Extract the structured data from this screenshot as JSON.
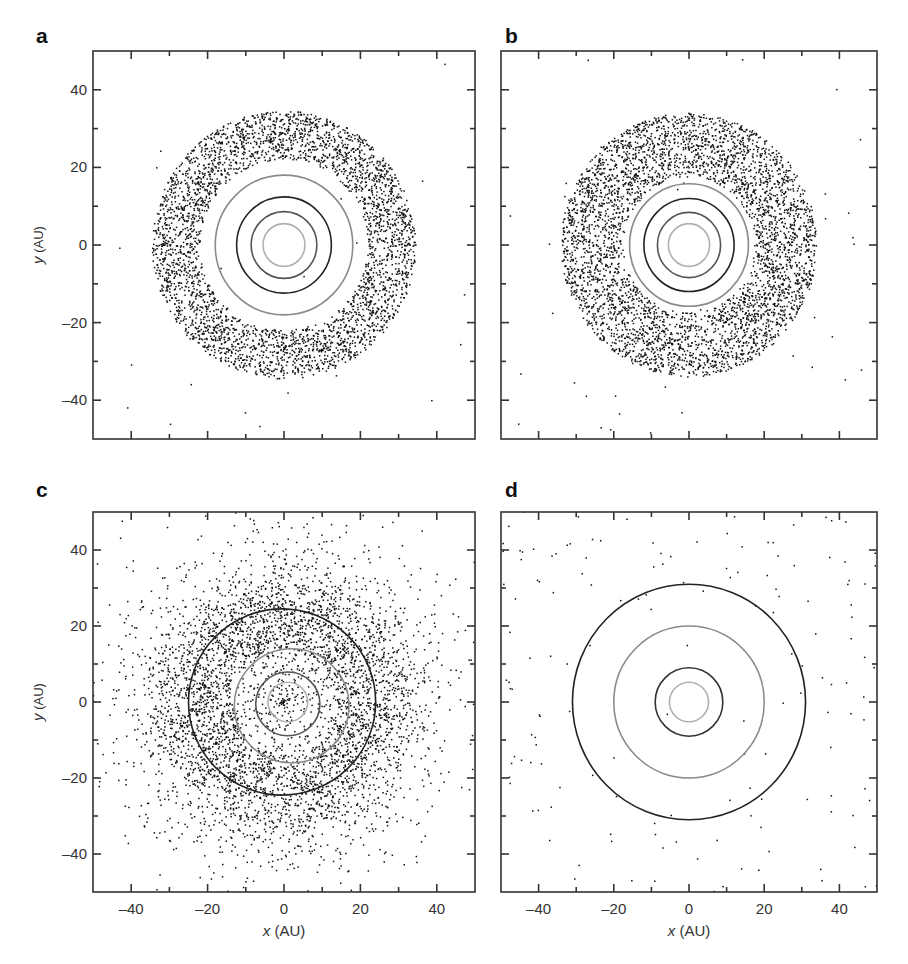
{
  "figure": {
    "panels": [
      {
        "id": "a",
        "letter": "a",
        "show_ylabel": true,
        "show_xlabel": false,
        "show_yticklabels": true,
        "show_xticklabels": false
      },
      {
        "id": "b",
        "letter": "b",
        "show_ylabel": false,
        "show_xlabel": false,
        "show_yticklabels": false,
        "show_xticklabels": false
      },
      {
        "id": "c",
        "letter": "c",
        "show_ylabel": true,
        "show_xlabel": true,
        "show_yticklabels": true,
        "show_xticklabels": true
      },
      {
        "id": "d",
        "letter": "d",
        "show_ylabel": false,
        "show_xlabel": true,
        "show_yticklabels": false,
        "show_xticklabels": true
      }
    ],
    "xlabel_var": "x",
    "xlabel_unit": " (AU)",
    "ylabel_var": "y",
    "ylabel_unit": " (AU)"
  },
  "chart_data": [
    {
      "panel": "a",
      "type": "scatter",
      "title": "",
      "xlabel": "x (AU)",
      "ylabel": "y (AU)",
      "xlim": [
        -50,
        50
      ],
      "ylim": [
        -50,
        50
      ],
      "xticks": [
        -40,
        -20,
        0,
        20,
        40
      ],
      "yticks": [
        -40,
        -20,
        0,
        20,
        40
      ],
      "minor_tick_step": 10,
      "grid": false,
      "orbits": [
        {
          "radius": 5.5,
          "color": "#b0b0b0"
        },
        {
          "radius": 8.6,
          "color": "#555555"
        },
        {
          "radius": 12.4,
          "color": "#222222"
        },
        {
          "radius": 18.0,
          "color": "#8a8a8a"
        }
      ],
      "particles": {
        "distribution": "annulus",
        "r_inner": 22,
        "r_outer": 34.5,
        "count": 3600,
        "scattered_count": 22,
        "center": [
          0,
          0
        ]
      }
    },
    {
      "panel": "b",
      "type": "scatter",
      "title": "",
      "xlabel": "",
      "ylabel": "",
      "xlim": [
        -50,
        50
      ],
      "ylim": [
        -50,
        50
      ],
      "xticks": [
        -40,
        -20,
        0,
        20,
        40
      ],
      "yticks": [
        -40,
        -20,
        0,
        20,
        40
      ],
      "minor_tick_step": 10,
      "grid": false,
      "orbits": [
        {
          "radius": 5.5,
          "color": "#b0b0b0"
        },
        {
          "radius": 8.4,
          "color": "#555555"
        },
        {
          "radius": 12.0,
          "color": "#222222"
        },
        {
          "radius": 15.8,
          "color": "#8a8a8a"
        }
      ],
      "particles": {
        "distribution": "annulus",
        "r_inner": 17.5,
        "r_outer": 34,
        "count": 4200,
        "scattered_count": 40,
        "center": [
          0,
          0
        ]
      }
    },
    {
      "panel": "c",
      "type": "scatter",
      "title": "",
      "xlabel": "x (AU)",
      "ylabel": "y (AU)",
      "xlim": [
        -50,
        50
      ],
      "ylim": [
        -50,
        50
      ],
      "xticks": [
        -40,
        -20,
        0,
        20,
        40
      ],
      "yticks": [
        -40,
        -20,
        0,
        20,
        40
      ],
      "minor_tick_step": 10,
      "grid": false,
      "orbits": [
        {
          "radius": 5.2,
          "color": "#b0b0b0",
          "cx": 1,
          "cy": 0
        },
        {
          "radius": 8.4,
          "color": "#555555",
          "cx": 1,
          "cy": -0.5
        },
        {
          "radius": 15.0,
          "color": "#8a8a8a",
          "cx": 2,
          "cy": -1
        },
        {
          "radius": 24.5,
          "color": "#222222",
          "cx": -0.5,
          "cy": 0
        }
      ],
      "particles": {
        "distribution": "gaussian_ring",
        "r_peak": 24,
        "sigma": 10,
        "count": 4800,
        "inner_sparse_radius": 14,
        "center": [
          0,
          0
        ]
      }
    },
    {
      "panel": "d",
      "type": "scatter",
      "title": "",
      "xlabel": "x (AU)",
      "ylabel": "y (AU)",
      "xlim": [
        -50,
        50
      ],
      "ylim": [
        -50,
        50
      ],
      "xticks": [
        -40,
        -20,
        0,
        20,
        40
      ],
      "yticks": [
        -40,
        -20,
        0,
        20,
        40
      ],
      "minor_tick_step": 10,
      "grid": false,
      "orbits": [
        {
          "radius": 5.2,
          "color": "#b0b0b0"
        },
        {
          "radius": 9.0,
          "color": "#333333"
        },
        {
          "radius": 20.0,
          "color": "#8a8a8a"
        },
        {
          "radius": 31.0,
          "color": "#222222"
        }
      ],
      "particles": {
        "distribution": "sparse_uniform",
        "r_min": 30,
        "count": 150,
        "center": [
          0,
          0
        ]
      }
    }
  ]
}
